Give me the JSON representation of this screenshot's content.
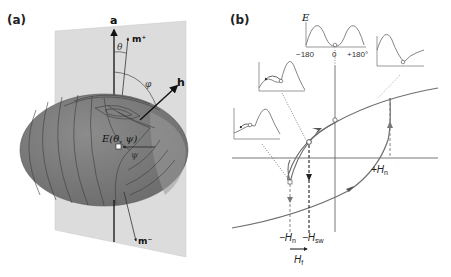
{
  "panel_a": {
    "label": "(a)",
    "axis_label": "a",
    "m_plus_label": "m⁺",
    "m_minus_label": "m⁻",
    "h_label": "h",
    "theta_label": "θ",
    "phi_label": "φ",
    "psi_label": "ψ",
    "energy_label": "E(θ, ψ)"
  },
  "panel_b": {
    "label": "(b)",
    "inset_energy_label": "E",
    "inset_ticks": [
      "−180",
      "0",
      "+180°"
    ],
    "plus_hn_label": "+H",
    "plus_hn_sub": "n",
    "minus_hn_label": "−H",
    "minus_hn_sub": "n",
    "minus_hsw_label": "−H",
    "minus_hsw_sub": "sw",
    "hf_label": "H",
    "hf_sub": "f"
  },
  "colors": {
    "plane": "#d9d9d9",
    "ellipsoid": "#7f7f7f",
    "ellipsoid_dark": "#5f5f5f",
    "contour": "#3a3a3a",
    "curve": "#6e6e6e",
    "axis": "#111111"
  }
}
